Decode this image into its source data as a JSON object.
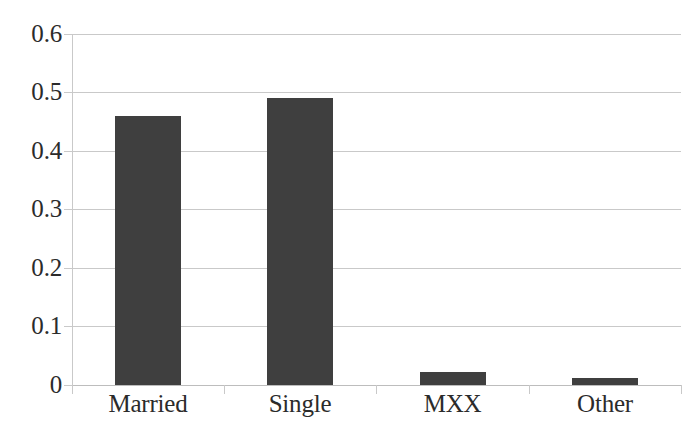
{
  "chart_data": {
    "type": "bar",
    "title": "",
    "subtitle": "",
    "xlabel": "",
    "ylabel": "",
    "categories": [
      "Married",
      "Single",
      "MXX",
      "Other"
    ],
    "values": [
      0.46,
      0.49,
      0.022,
      0.012
    ],
    "series": [
      {
        "name": "",
        "values": [
          0.46,
          0.49,
          0.022,
          0.012
        ]
      }
    ],
    "ylim": [
      0,
      0.6
    ],
    "ytick_labels": [
      "0.6",
      "0.5",
      "0.4",
      "0.3",
      "0.2",
      "0.1",
      "0"
    ],
    "ytick_values": [
      0.6,
      0.5,
      0.4,
      0.3,
      0.2,
      0.1,
      0
    ],
    "grid": "horizontal",
    "legend": "none",
    "bar_color": "#3f3f3f",
    "grid_color": "#c9c9c9",
    "axis_color": "#c9c9c9",
    "text_color": "#2b2b2b",
    "background": "#ffffff",
    "annotations": []
  }
}
